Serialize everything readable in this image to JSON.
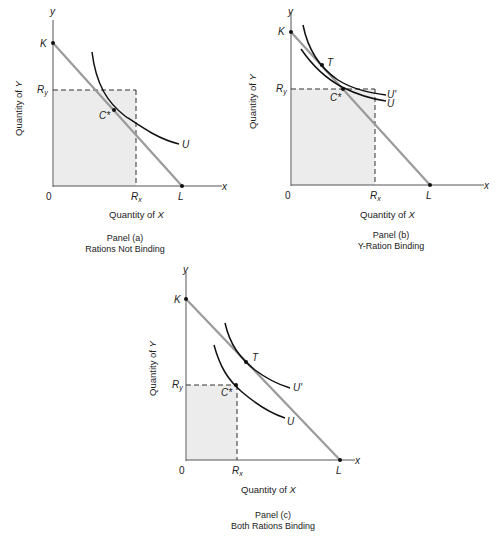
{
  "colors": {
    "budget_line": "#9a9a9a",
    "axis": "#555555",
    "curve": "#111111",
    "shade": "#ececec",
    "text": "#222222"
  },
  "panels": [
    {
      "id": "a",
      "caption_line1": "Panel (a)",
      "caption_line2": "Rations Not Binding",
      "x_axis_title_prefix": "Quantity of ",
      "x_axis_var": "X",
      "y_axis_title_prefix": "Quantity of ",
      "y_axis_var": "Y",
      "labels": {
        "y": "y",
        "x": "x",
        "K": "K",
        "Ry": "R",
        "Ry_sub": "y",
        "Rx": "R",
        "Rx_sub": "x",
        "origin": "0",
        "L": "L",
        "C": "C*",
        "U": "U"
      }
    },
    {
      "id": "b",
      "caption_line1": "Panel (b)",
      "caption_line2": "Y-Ration Binding",
      "x_axis_title_prefix": "Quantity of ",
      "x_axis_var": "X",
      "y_axis_title_prefix": "Quantity of ",
      "y_axis_var": "Y",
      "labels": {
        "y": "y",
        "x": "x",
        "K": "K",
        "Ry": "R",
        "Ry_sub": "y",
        "Rx": "R",
        "Rx_sub": "x",
        "origin": "0",
        "L": "L",
        "C": "C*",
        "T": "T",
        "U": "U",
        "Up": "U'"
      }
    },
    {
      "id": "c",
      "caption_line1": "Panel (c)",
      "caption_line2": "Both Rations Binding",
      "x_axis_title_prefix": "Quantity of ",
      "x_axis_var": "X",
      "y_axis_title_prefix": "Quantity of ",
      "y_axis_var": "Y",
      "labels": {
        "y": "y",
        "x": "x",
        "K": "K",
        "Ry": "R",
        "Ry_sub": "y",
        "Rx": "R",
        "Rx_sub": "x",
        "origin": "0",
        "L": "L",
        "C": "C*",
        "T": "T",
        "U": "U",
        "Up": "U'"
      }
    }
  ]
}
